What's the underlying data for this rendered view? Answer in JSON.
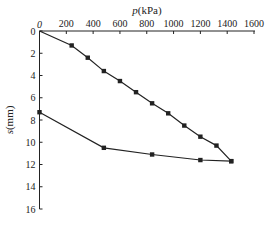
{
  "chart_data": {
    "type": "line",
    "title": "",
    "xlabel": "p(kPa)",
    "xlabel_italic": "p",
    "xlabel_unit": "(kPa)",
    "ylabel": "s(mm)",
    "ylabel_italic": "s",
    "ylabel_unit": "(mm)",
    "x_axis_position": "top",
    "y_axis_inverted": true,
    "xlim": [
      0,
      1600
    ],
    "ylim": [
      0,
      16
    ],
    "xticks": [
      0,
      200,
      400,
      600,
      800,
      1000,
      1200,
      1400,
      1600
    ],
    "yticks": [
      0,
      2,
      4,
      6,
      8,
      10,
      12,
      14,
      16
    ],
    "grid": false,
    "legend": null,
    "marker": "square",
    "color": "#222222",
    "series": [
      {
        "name": "loading",
        "x": [
          0,
          240,
          360,
          480,
          600,
          720,
          840,
          960,
          1080,
          1200,
          1320,
          1430
        ],
        "y": [
          0,
          1.3,
          2.4,
          3.6,
          4.5,
          5.5,
          6.5,
          7.4,
          8.5,
          9.5,
          10.3,
          11.7
        ]
      },
      {
        "name": "unloading",
        "x": [
          1430,
          1200,
          840,
          480,
          0
        ],
        "y": [
          11.7,
          11.6,
          11.1,
          10.5,
          7.3
        ]
      }
    ]
  }
}
